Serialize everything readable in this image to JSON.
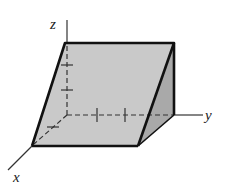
{
  "figure": {
    "axes": {
      "x_label": "x",
      "y_label": "y",
      "z_label": "z"
    },
    "colors": {
      "face_front": "#c8c8c8",
      "face_side": "#a8a8a8",
      "edge": "#111111",
      "axis": "#333333"
    }
  }
}
